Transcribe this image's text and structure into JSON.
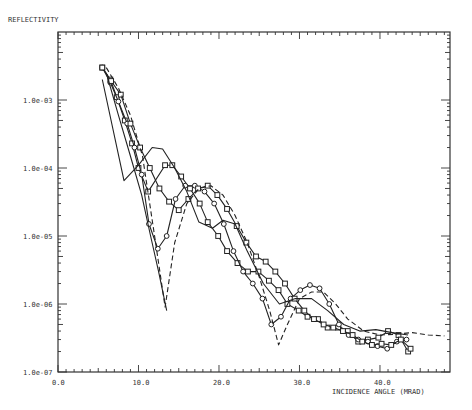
{
  "chart_data": {
    "type": "line",
    "title": "",
    "xlabel": "INCIDENCE ANGLE (MRAD)",
    "ylabel": "REFLECTIVITY",
    "xlim": [
      0,
      48.7
    ],
    "ylim": [
      1e-07,
      0.01
    ],
    "yscale": "log",
    "grid": false,
    "legend": null,
    "x_ticks": [
      0.0,
      10.0,
      20.0,
      30.0,
      40.0
    ],
    "x_tick_labels": [
      "0.0",
      "10.0",
      "20.0",
      "30.0",
      "40.0"
    ],
    "y_ticks": [
      0.001,
      0.0001,
      1e-05,
      1e-06,
      1e-07
    ],
    "y_tick_labels": [
      "1.0e-03",
      "1.0e-04",
      "1.0e-05",
      "1.0e-06",
      "1.0e-07"
    ],
    "series": [
      {
        "name": "squares-1",
        "style": "solid",
        "marker": "square",
        "x": [
          5.5,
          6.5,
          7.3,
          8.3,
          9.2,
          10.0,
          11.2,
          13.3,
          14.2,
          15.3,
          16.4,
          17.6,
          18.6,
          19.9,
          21.0,
          22.3,
          23.6,
          24.9,
          26.2,
          27.4,
          28.5,
          29.9,
          31.0,
          32.3,
          33.5,
          34.8,
          36.0,
          37.3,
          38.5,
          39.8,
          41.0,
          42.3,
          43.5
        ],
        "y": [
          0.003,
          0.002,
          0.0011,
          0.0005,
          0.00023,
          0.0001,
          4.5e-05,
          0.00011,
          0.00011,
          7.5e-05,
          5e-05,
          3e-05,
          1.6e-05,
          1e-05,
          6e-06,
          4e-06,
          3e-06,
          3e-06,
          2.2e-06,
          1.6e-06,
          1e-06,
          8e-07,
          6.5e-07,
          6e-07,
          4.5e-07,
          4.5e-07,
          4e-07,
          2.8e-07,
          3e-07,
          3.2e-07,
          4e-07,
          3.5e-07,
          2e-07
        ]
      },
      {
        "name": "circles-1",
        "style": "solid",
        "marker": "circle",
        "x": [
          5.5,
          6.5,
          7.5,
          8.6,
          9.5,
          10.4,
          11.3,
          12.4,
          13.5,
          14.6,
          15.8,
          17.0,
          18.2,
          19.4,
          20.6,
          21.8,
          23.0,
          24.2,
          25.4,
          26.5,
          27.7,
          28.9,
          30.1,
          31.3,
          32.5,
          33.7,
          34.9,
          36.1,
          37.3,
          38.5,
          39.7,
          40.9,
          42.1,
          43.3
        ],
        "y": [
          0.003,
          0.0018,
          0.00095,
          0.00045,
          0.0002,
          8e-05,
          1.5e-05,
          6.5e-06,
          1e-05,
          3.5e-05,
          5.5e-05,
          5.5e-05,
          4.5e-05,
          3e-05,
          1.5e-05,
          6e-06,
          3e-06,
          2e-06,
          1.2e-06,
          5e-07,
          6.5e-07,
          1.2e-06,
          1.6e-06,
          1.9e-06,
          1.7e-06,
          1e-06,
          5e-07,
          3.5e-07,
          3e-07,
          2.8e-07,
          2.4e-07,
          2.2e-07,
          2.8e-07,
          3e-07
        ]
      },
      {
        "name": "squares-2",
        "style": "solid",
        "marker": "square",
        "x": [
          5.5,
          6.6,
          7.8,
          9.0,
          10.2,
          11.4,
          12.6,
          13.8,
          15.0,
          16.2,
          17.4,
          18.6,
          19.8,
          21.0,
          22.2,
          23.4,
          24.6,
          25.8,
          27.0,
          28.2,
          29.4,
          30.6,
          31.8,
          33.0,
          34.2,
          35.4,
          36.6,
          37.8,
          39.0,
          40.2,
          41.4,
          42.6,
          43.8
        ],
        "y": [
          0.003,
          0.0019,
          0.0012,
          0.00045,
          0.0002,
          0.0001,
          5e-05,
          3.2e-05,
          2.4e-05,
          3.5e-05,
          5e-05,
          5.5e-05,
          4e-05,
          2.5e-05,
          1.4e-05,
          8e-06,
          5e-06,
          4.2e-06,
          3e-06,
          2e-06,
          1.2e-06,
          8e-07,
          6e-07,
          5e-07,
          4.5e-07,
          4e-07,
          3.5e-07,
          2.8e-07,
          2.5e-07,
          2.6e-07,
          2.5e-07,
          3e-07,
          2.2e-07
        ]
      },
      {
        "name": "solid-1",
        "style": "solid",
        "marker": "none",
        "x": [
          5.5,
          8.2,
          10.0,
          11.7,
          13.0,
          14.5,
          16.0,
          17.5,
          19.2,
          20.5,
          22.0,
          23.5,
          25.5,
          27.5,
          29.5,
          31.5,
          33.5,
          35.5,
          37.5,
          39.5,
          41.5,
          43.5
        ],
        "y": [
          0.002,
          6.5e-05,
          0.00011,
          0.0002,
          0.00019,
          0.0001,
          4.5e-05,
          1.6e-05,
          1.3e-05,
          1.7e-05,
          1.5e-05,
          6e-06,
          2e-06,
          1e-06,
          1.2e-06,
          1.2e-06,
          8e-07,
          5e-07,
          4e-07,
          4.2e-07,
          3.8e-07,
          3.5e-07
        ]
      },
      {
        "name": "solid-2",
        "style": "solid",
        "marker": "none",
        "x": [
          6.0,
          7.5,
          9.0,
          10.4,
          11.5,
          12.5,
          13.5
        ],
        "y": [
          0.0025,
          0.0006,
          0.00015,
          4e-05,
          1e-05,
          3e-06,
          8e-07
        ]
      },
      {
        "name": "dashed",
        "style": "dashed",
        "marker": "none",
        "x": [
          6.0,
          7.5,
          9.0,
          10.5,
          12.0,
          13.3,
          14.5,
          16.0,
          17.5,
          19.0,
          20.5,
          22.0,
          23.5,
          25.0,
          26.3,
          27.4,
          28.5,
          30.0,
          31.5,
          33.0,
          34.5,
          36.0,
          38.0,
          40.0,
          42.0,
          44.0,
          46.0,
          48.0
        ],
        "y": [
          0.003,
          0.0015,
          0.0006,
          0.00015,
          1e-05,
          9e-07,
          8e-06,
          3e-05,
          5e-05,
          5.5e-05,
          4e-05,
          2e-05,
          8e-06,
          2.5e-06,
          8e-07,
          2.5e-07,
          5e-07,
          1.2e-06,
          1.5e-06,
          1.5e-06,
          1e-06,
          6e-07,
          4e-07,
          3.5e-07,
          3.6e-07,
          3.8e-07,
          3.5e-07,
          3.4e-07
        ]
      }
    ]
  }
}
